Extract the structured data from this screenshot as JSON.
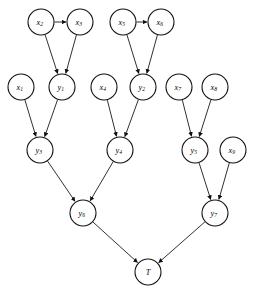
{
  "diagram": {
    "type": "dag",
    "background_color": "#ffffff",
    "node_fill": "#ffffff",
    "node_stroke": "#111111",
    "edge_color": "#1a1a1a",
    "node_radius": 13,
    "canvas": {
      "width": 257,
      "height": 299
    },
    "nodes": [
      {
        "id": "x2",
        "base": "x",
        "sub": "2",
        "label": "x2",
        "cx": 41,
        "cy": 22
      },
      {
        "id": "x3",
        "base": "x",
        "sub": "3",
        "label": "x3",
        "cx": 80,
        "cy": 22
      },
      {
        "id": "x5",
        "base": "x",
        "sub": "5",
        "label": "x5",
        "cx": 123,
        "cy": 22
      },
      {
        "id": "x6",
        "base": "x",
        "sub": "6",
        "label": "x6",
        "cx": 161,
        "cy": 22
      },
      {
        "id": "x1",
        "base": "x",
        "sub": "1",
        "label": "x1",
        "cx": 21,
        "cy": 87
      },
      {
        "id": "y1",
        "base": "y",
        "sub": "1",
        "label": "y1",
        "cx": 62,
        "cy": 87
      },
      {
        "id": "x4",
        "base": "x",
        "sub": "4",
        "label": "x4",
        "cx": 104,
        "cy": 87
      },
      {
        "id": "y2",
        "base": "y",
        "sub": "2",
        "label": "y2",
        "cx": 143,
        "cy": 87
      },
      {
        "id": "x7",
        "base": "x",
        "sub": "7",
        "label": "x7",
        "cx": 179,
        "cy": 87
      },
      {
        "id": "x8",
        "base": "x",
        "sub": "8",
        "label": "x8",
        "cx": 215,
        "cy": 87
      },
      {
        "id": "y3",
        "base": "y",
        "sub": "3",
        "label": "y3",
        "cx": 40,
        "cy": 150
      },
      {
        "id": "y4",
        "base": "y",
        "sub": "4",
        "label": "y4",
        "cx": 120,
        "cy": 150
      },
      {
        "id": "y5",
        "base": "y",
        "sub": "5",
        "label": "y5",
        "cx": 195,
        "cy": 150
      },
      {
        "id": "x9",
        "base": "x",
        "sub": "9",
        "label": "x9",
        "cx": 233,
        "cy": 150
      },
      {
        "id": "y6",
        "base": "y",
        "sub": "6",
        "label": "y6",
        "cx": 83,
        "cy": 213
      },
      {
        "id": "y7",
        "base": "y",
        "sub": "7",
        "label": "y7",
        "cx": 215,
        "cy": 213
      },
      {
        "id": "T",
        "base": "T",
        "sub": "",
        "label": "T",
        "cx": 148,
        "cy": 272
      }
    ],
    "edges": [
      {
        "from": "x2",
        "to": "x3"
      },
      {
        "from": "x2",
        "to": "y1"
      },
      {
        "from": "x3",
        "to": "y1"
      },
      {
        "from": "x5",
        "to": "x6"
      },
      {
        "from": "x5",
        "to": "y2"
      },
      {
        "from": "x6",
        "to": "y2"
      },
      {
        "from": "x1",
        "to": "y3"
      },
      {
        "from": "y1",
        "to": "y3"
      },
      {
        "from": "x4",
        "to": "y4"
      },
      {
        "from": "y2",
        "to": "y4"
      },
      {
        "from": "x7",
        "to": "y5"
      },
      {
        "from": "x8",
        "to": "y5"
      },
      {
        "from": "y3",
        "to": "y6"
      },
      {
        "from": "y4",
        "to": "y6"
      },
      {
        "from": "y5",
        "to": "y7"
      },
      {
        "from": "x9",
        "to": "y7"
      },
      {
        "from": "y6",
        "to": "T"
      },
      {
        "from": "y7",
        "to": "T"
      }
    ]
  }
}
